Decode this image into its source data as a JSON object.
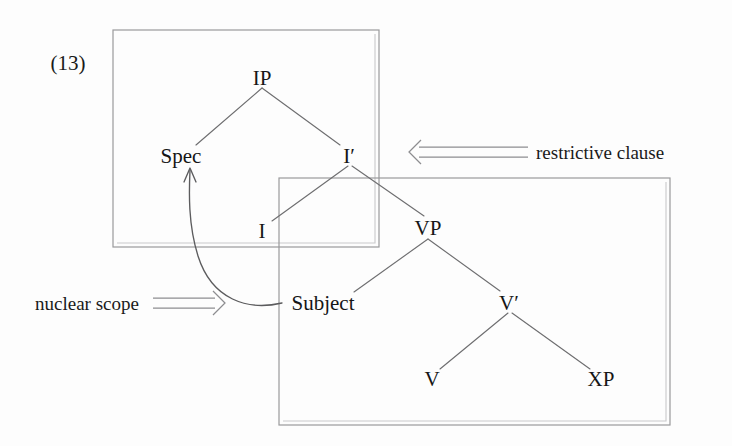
{
  "figure": {
    "example_number": "(13)",
    "description_type": "x-bar-syntax-tree"
  },
  "trees": {
    "upper": {
      "name": "IP-tree",
      "nodes": [
        {
          "id": "IP",
          "label": "IP",
          "x": 262,
          "y": 78
        },
        {
          "id": "Spec",
          "label": "Spec",
          "x": 181,
          "y": 157
        },
        {
          "id": "Ibar",
          "label": "I′",
          "x": 349,
          "y": 157
        },
        {
          "id": "I",
          "label": "I",
          "x": 262,
          "y": 232
        }
      ],
      "edges": [
        {
          "from": "IP",
          "to": "Spec"
        },
        {
          "from": "IP",
          "to": "Ibar"
        },
        {
          "from": "Ibar",
          "to": "I"
        },
        {
          "from": "Ibar",
          "to": "VP"
        }
      ]
    },
    "lower": {
      "name": "VP-tree",
      "nodes": [
        {
          "id": "VP",
          "label": "VP",
          "x": 428,
          "y": 229
        },
        {
          "id": "Subject",
          "label": "Subject",
          "x": 323,
          "y": 303
        },
        {
          "id": "Vbar",
          "label": "V′",
          "x": 509,
          "y": 303
        },
        {
          "id": "V",
          "label": "V",
          "x": 432,
          "y": 380
        },
        {
          "id": "XP",
          "label": "XP",
          "x": 601,
          "y": 380
        }
      ],
      "edges": [
        {
          "from": "VP",
          "to": "Subject"
        },
        {
          "from": "VP",
          "to": "Vbar"
        },
        {
          "from": "Vbar",
          "to": "V"
        },
        {
          "from": "Vbar",
          "to": "XP"
        }
      ]
    }
  },
  "regions": [
    {
      "id": "restrictive-clause-box",
      "label_ref": "restrictive clause",
      "x": 113,
      "y": 30,
      "width": 266,
      "height": 217
    },
    {
      "id": "nuclear-scope-box",
      "label_ref": "nuclear scope",
      "x": 279,
      "y": 178,
      "width": 391,
      "height": 247
    }
  ],
  "annotations": [
    {
      "id": "restrictive-clause",
      "text": "restrictive clause",
      "arrow_glyph": "⟸",
      "arrow_direction": "left",
      "text_x": 536,
      "text_y": 158,
      "arrow_from_x": 528,
      "arrow_to_x": 410,
      "arrow_y": 152
    },
    {
      "id": "nuclear-scope",
      "text": "nuclear scope",
      "arrow_glyph": "⟹",
      "arrow_direction": "right",
      "text_x": 35,
      "text_y": 310,
      "arrow_from_x": 153,
      "arrow_to_x": 222,
      "arrow_y": 303
    }
  ],
  "movement_arrow": {
    "id": "subject-to-spec-movement",
    "from_node": "Subject",
    "to_node": "Spec",
    "start_x": 279,
    "start_y": 303,
    "end_x": 190,
    "end_y": 170
  },
  "colors": {
    "background": "#fdfdfd",
    "text": "#161616",
    "branch_line": "#6e6e70",
    "box_line": "#9a9a9c",
    "arrow_line": "#8d8d90",
    "movement_arrow": "#5c5c5e"
  }
}
